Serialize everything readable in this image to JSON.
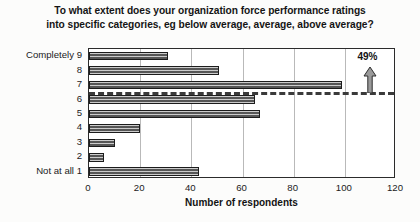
{
  "chart_data": {
    "type": "bar",
    "orientation": "horizontal",
    "title": "To what extent does your organization force performance ratings into specific categories, eg below average, average, above average?",
    "title_lines": [
      "To what extent does your organization force performance ratings",
      "into specific categories, eg below average, average, above average?"
    ],
    "xlabel": "Number of respondents",
    "ylabel": "",
    "categories": [
      "1",
      "2",
      "3",
      "4",
      "5",
      "6",
      "7",
      "8",
      "9"
    ],
    "values": [
      43,
      6,
      10,
      20,
      67,
      65,
      99,
      51,
      31
    ],
    "category_anchors": {
      "top": "Completely",
      "top_category": "9",
      "bottom": "Not at all",
      "bottom_category": "1"
    },
    "xlim": [
      0,
      120
    ],
    "xticks": [
      0,
      20,
      40,
      60,
      80,
      100,
      120
    ],
    "xtick_labels": [
      "0",
      "20",
      "40",
      "60",
      "80",
      "100",
      "120"
    ],
    "grid": "vertical",
    "legend": "none",
    "annotations": [
      {
        "text": "49%",
        "type": "arrow-callout",
        "x": 110,
        "points_to": "reference-line",
        "description": "Upward arrow from dashed reference line between categories 6 and 7"
      }
    ],
    "reference_line": {
      "style": "dashed",
      "between_categories": [
        "6",
        "7"
      ],
      "orientation": "horizontal"
    },
    "colors": {
      "bar_fill": "#8d8d8d",
      "bar_edge": "#1c1c1c",
      "grid": "#b9b9b9",
      "axis": "#2b2b2b",
      "text": "#1b1b1b"
    }
  }
}
